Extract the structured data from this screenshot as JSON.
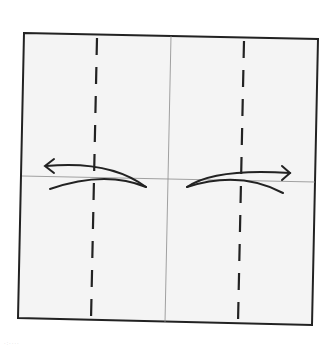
{
  "diagram": {
    "type": "origami-fold-step",
    "paper_color": "#f4f4f4",
    "line_color": "#222222",
    "crease_color": "#8a8a8a",
    "elements": {
      "paper": "square-sheet",
      "creases": [
        "vertical-center-crease",
        "horizontal-center-crease"
      ],
      "valley_folds": [
        "left-quarter-valley-fold",
        "right-quarter-valley-fold"
      ],
      "arrows": [
        {
          "name": "fold-and-unfold-left",
          "direction": "left"
        },
        {
          "name": "fold-and-unfold-right",
          "direction": "right"
        }
      ]
    }
  }
}
